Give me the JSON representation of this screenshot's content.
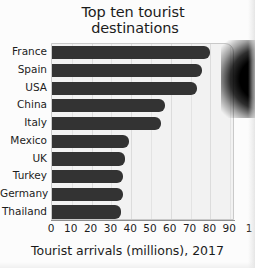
{
  "chart_data": {
    "type": "bar",
    "orientation": "horizontal",
    "title": "Top ten tourist destinations",
    "title_lines": [
      "Top ten tourist",
      "destinations"
    ],
    "xlabel": "Tourist arrivals (millions), 2017",
    "ylabel": "",
    "categories": [
      "France",
      "Spain",
      "USA",
      "China",
      "Italy",
      "Mexico",
      "UK",
      "Turkey",
      "Germany",
      "Thailand"
    ],
    "values": [
      80,
      76,
      73,
      57,
      55,
      39,
      37,
      36,
      36,
      35
    ],
    "xlim": [
      0,
      100
    ],
    "xticks": [
      0,
      10,
      20,
      30,
      40,
      50,
      60,
      70,
      80,
      90,
      100
    ],
    "xtick_labels": [
      "0",
      "10",
      "20",
      "30",
      "40",
      "50",
      "60",
      "70",
      "80",
      "90",
      "1"
    ],
    "grid": true,
    "grid_axis": "x",
    "legend": "none",
    "bar_color": "#333333",
    "plot_background": "#f2f2f2",
    "figure_background": "#fcfcfc"
  },
  "figure": {
    "title_line1": "Top ten tourist",
    "title_line2": "destinations",
    "x_axis_label": "Tourist arrivals (millions), 2017"
  },
  "bars": [
    {
      "label": "France",
      "value": 80
    },
    {
      "label": "Spain",
      "value": 76
    },
    {
      "label": "USA",
      "value": 73
    },
    {
      "label": "China",
      "value": 57
    },
    {
      "label": "Italy",
      "value": 55
    },
    {
      "label": "Mexico",
      "value": 39
    },
    {
      "label": "UK",
      "value": 37
    },
    {
      "label": "Turkey",
      "value": 36
    },
    {
      "label": "Germany",
      "value": 36
    },
    {
      "label": "Thailand",
      "value": 35
    }
  ],
  "xticks": [
    {
      "label": "0",
      "value": 0
    },
    {
      "label": "10",
      "value": 10
    },
    {
      "label": "20",
      "value": 20
    },
    {
      "label": "30",
      "value": 30
    },
    {
      "label": "40",
      "value": 40
    },
    {
      "label": "50",
      "value": 50
    },
    {
      "label": "60",
      "value": 60
    },
    {
      "label": "70",
      "value": 70
    },
    {
      "label": "80",
      "value": 80
    },
    {
      "label": "90",
      "value": 90
    },
    {
      "label": "1",
      "value": 100
    }
  ]
}
